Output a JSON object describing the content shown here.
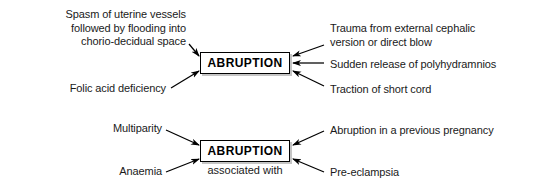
{
  "diagram": {
    "title_text": "ABRUPTION causes and associations",
    "type": "concept-map",
    "sections": [
      {
        "id": "causes",
        "center_label": "ABRUPTION",
        "caption": "",
        "left_items": [
          "Spasm of uterine vessels\nfollowed by flooding into\nchorio-decidual space",
          "Folic acid deficiency"
        ],
        "right_items": [
          "Trauma from external cephalic\nversion or direct blow",
          "Sudden release of polyhydramnios",
          "Traction of short cord"
        ]
      },
      {
        "id": "associations",
        "center_label": "ABRUPTION",
        "caption": "associated with",
        "left_items": [
          "Multiparity",
          "Anaemia"
        ],
        "right_items": [
          "Abruption in a previous pregnancy",
          "Pre-eclampsia"
        ]
      }
    ]
  },
  "colors": {
    "background": "#ffffff",
    "text": "#1a1a1a",
    "box_border": "#000000",
    "box_fill": "#ffffff",
    "arrow": "#000000",
    "shadow": "#969696"
  }
}
